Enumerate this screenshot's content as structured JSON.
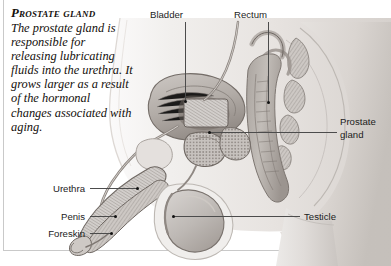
{
  "figure": {
    "caption": {
      "heading": "Prostate gland",
      "body": "The prostate gland is responsible for releasing lubricating fluids into the urethra. It grows larger as a result of the hormonal changes associated with aging."
    },
    "labels": {
      "bladder": "Bladder",
      "rectum": "Rectum",
      "prostate_gland_line1": "Prostate",
      "prostate_gland_line2": "gland",
      "urethra": "Urethra",
      "penis": "Penis",
      "foreskin": "Foreskin",
      "testicle": "Testicle"
    },
    "colors": {
      "background": "#ffffff",
      "frame": "#c9c9c9",
      "leader_line": "#4c4c4c",
      "marker_dot": "#111111",
      "text": "#1c1c1c",
      "caption_text": "#14100c",
      "skin_light": "#f2f0ee",
      "skin_mid": "#e2dedb",
      "skin_shadow": "#cfcac6",
      "organ_light": "#d8d4d1",
      "organ_mid": "#bdb8b4",
      "organ_dark": "#968f8a",
      "outline": "#7a736e"
    }
  }
}
